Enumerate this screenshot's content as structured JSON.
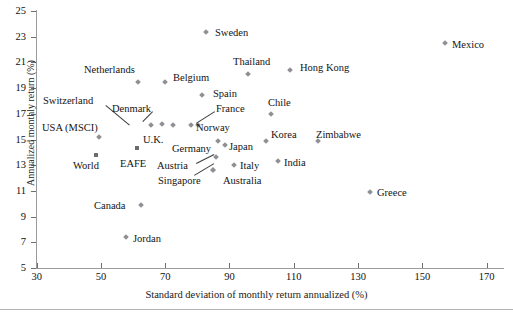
{
  "chart_data": {
    "type": "scatter",
    "title": "",
    "xlabel": "Standard deviation of monthly return annualized (%)",
    "ylabel": "Annualized monthly return (%)",
    "xlim": [
      30,
      180
    ],
    "ylim": [
      5,
      25
    ],
    "xticks": [
      30,
      50,
      70,
      90,
      110,
      130,
      150,
      170
    ],
    "yticks": [
      5,
      7,
      9,
      11,
      13,
      15,
      17,
      19,
      21,
      23,
      25
    ],
    "grid": false,
    "legend": "none",
    "marker_colors": {
      "diamond": "#8f8f95",
      "square": "#6b6b6b"
    },
    "points": [
      {
        "name": "Sweden",
        "x": 82.8,
        "y": 23.4,
        "marker": "diamond"
      },
      {
        "name": "Mexico",
        "x": 157.0,
        "y": 22.5,
        "marker": "diamond"
      },
      {
        "name": "Thailand",
        "x": 95.8,
        "y": 20.1,
        "marker": "diamond"
      },
      {
        "name": "Hong Kong",
        "x": 108.8,
        "y": 20.4,
        "marker": "diamond"
      },
      {
        "name": "Netherlands",
        "x": 61.6,
        "y": 19.5,
        "marker": "diamond"
      },
      {
        "name": "Belgium",
        "x": 70.0,
        "y": 19.5,
        "marker": "diamond"
      },
      {
        "name": "Spain",
        "x": 81.5,
        "y": 18.5,
        "marker": "diamond"
      },
      {
        "name": "Chile",
        "x": 103.0,
        "y": 17.0,
        "marker": "diamond"
      },
      {
        "name": "Switzerland",
        "x": 65.5,
        "y": 16.1,
        "marker": "diamond"
      },
      {
        "name": "Denmark",
        "x": 69.0,
        "y": 16.2,
        "marker": "diamond"
      },
      {
        "name": "U.K.",
        "x": 72.5,
        "y": 16.1,
        "marker": "diamond"
      },
      {
        "name": "France",
        "x": 78.0,
        "y": 16.1,
        "marker": "diamond"
      },
      {
        "name": "Norway",
        "x": 80.3,
        "y": 16.1,
        "marker": "diamond"
      },
      {
        "name": "USA (MSCI)",
        "x": 49.4,
        "y": 15.2,
        "marker": "diamond"
      },
      {
        "name": "Korea",
        "x": 101.5,
        "y": 14.9,
        "marker": "diamond"
      },
      {
        "name": "Zimbabwe",
        "x": 117.6,
        "y": 14.9,
        "marker": "diamond"
      },
      {
        "name": "Germany",
        "x": 86.5,
        "y": 14.9,
        "marker": "diamond"
      },
      {
        "name": "Japan",
        "x": 88.7,
        "y": 14.6,
        "marker": "diamond"
      },
      {
        "name": "World",
        "x": 48.5,
        "y": 13.8,
        "marker": "square"
      },
      {
        "name": "EAFE",
        "x": 61.3,
        "y": 14.3,
        "marker": "square"
      },
      {
        "name": "Austria",
        "x": 85.8,
        "y": 13.6,
        "marker": "diamond"
      },
      {
        "name": "Italy",
        "x": 91.5,
        "y": 13.0,
        "marker": "diamond"
      },
      {
        "name": "India",
        "x": 105.0,
        "y": 13.3,
        "marker": "diamond"
      },
      {
        "name": "Singapore",
        "x": 85.0,
        "y": 12.6,
        "marker": "diamond"
      },
      {
        "name": "Australia",
        "x": 85.0,
        "y": 12.6,
        "marker": "diamond"
      },
      {
        "name": "Greece",
        "x": 133.8,
        "y": 10.9,
        "marker": "diamond"
      },
      {
        "name": "Canada",
        "x": 62.5,
        "y": 9.9,
        "marker": "diamond"
      },
      {
        "name": "Jordan",
        "x": 57.8,
        "y": 7.4,
        "marker": "diamond"
      }
    ],
    "annotations": [
      {
        "text": "Sweden",
        "px": 215,
        "py": 27
      },
      {
        "text": "Mexico",
        "px": 452,
        "py": 39
      },
      {
        "text": "Thailand",
        "px": 233,
        "py": 56
      },
      {
        "text": "Hong Kong",
        "px": 300,
        "py": 62
      },
      {
        "text": "Netherlands",
        "px": 84,
        "py": 64
      },
      {
        "text": "Belgium",
        "px": 173,
        "py": 72
      },
      {
        "text": "Spain",
        "px": 213,
        "py": 88
      },
      {
        "text": "Chile",
        "px": 268,
        "py": 97
      },
      {
        "text": "Switzerland",
        "px": 43,
        "py": 95
      },
      {
        "text": "Denmark",
        "px": 112,
        "py": 103
      },
      {
        "text": "France",
        "px": 216,
        "py": 103
      },
      {
        "text": "Norway",
        "px": 196,
        "py": 122
      },
      {
        "text": "USA (MSCI)",
        "px": 42,
        "py": 122
      },
      {
        "text": "U.K.",
        "px": 143,
        "py": 134
      },
      {
        "text": "Korea",
        "px": 271,
        "py": 129
      },
      {
        "text": "Zimbabwe",
        "px": 316,
        "py": 129
      },
      {
        "text": "Germany",
        "px": 172,
        "py": 143
      },
      {
        "text": "Japan",
        "px": 229,
        "py": 141
      },
      {
        "text": "World",
        "px": 73,
        "py": 160
      },
      {
        "text": "EAFE",
        "px": 120,
        "py": 158
      },
      {
        "text": "Austria",
        "px": 157,
        "py": 160
      },
      {
        "text": "Italy",
        "px": 240,
        "py": 160
      },
      {
        "text": "India",
        "px": 284,
        "py": 157
      },
      {
        "text": "Singapore",
        "px": 158,
        "py": 175
      },
      {
        "text": "Australia",
        "px": 223,
        "py": 175
      },
      {
        "text": "Greece",
        "px": 377,
        "py": 187
      },
      {
        "text": "Canada",
        "px": 94,
        "py": 200
      },
      {
        "text": "Jordan",
        "px": 133,
        "py": 233
      }
    ],
    "leaders": [
      {
        "from_px": 106,
        "from_py": 105,
        "to_px": 130,
        "to_py": 125
      },
      {
        "from_px": 153,
        "from_py": 112,
        "to_px": 143,
        "to_py": 122
      },
      {
        "from_px": 215,
        "from_py": 112,
        "to_px": 196,
        "to_py": 124
      },
      {
        "from_px": 196,
        "from_py": 163,
        "to_px": 214,
        "to_py": 154
      },
      {
        "from_px": 194,
        "from_py": 175,
        "to_px": 214,
        "to_py": 163
      }
    ]
  }
}
